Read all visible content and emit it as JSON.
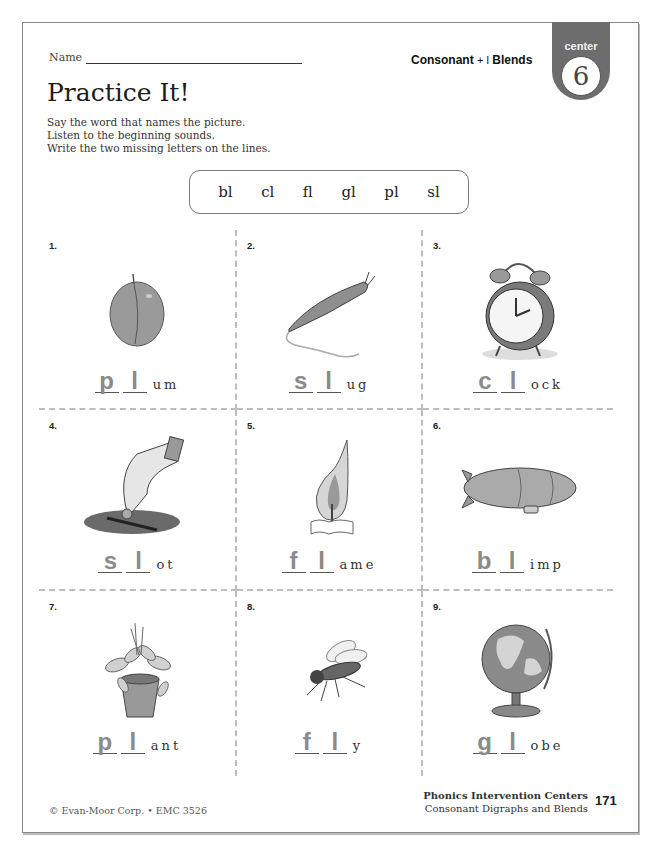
{
  "header": {
    "name_label": "Name",
    "topic_left": "Consonant",
    "topic_plus": "+ l",
    "topic_right": "Blends",
    "badge_label": "center",
    "badge_number": "6"
  },
  "title": "Practice It!",
  "instructions": [
    "Say the word that names the picture.",
    "Listen to the beginning sounds.",
    "Write the two missing letters on the lines."
  ],
  "word_bank": [
    "bl",
    "cl",
    "fl",
    "gl",
    "pl",
    "sl"
  ],
  "items": [
    {
      "number": "1.",
      "picture": "plum-icon",
      "letter1": "p",
      "letter2": "l",
      "rest": "um"
    },
    {
      "number": "2.",
      "picture": "slug-icon",
      "letter1": "s",
      "letter2": "l",
      "rest": "ug"
    },
    {
      "number": "3.",
      "picture": "clock-icon",
      "letter1": "c",
      "letter2": "l",
      "rest": "ock"
    },
    {
      "number": "4.",
      "picture": "slot-icon",
      "letter1": "s",
      "letter2": "l",
      "rest": "ot"
    },
    {
      "number": "5.",
      "picture": "flame-icon",
      "letter1": "f",
      "letter2": "l",
      "rest": "ame"
    },
    {
      "number": "6.",
      "picture": "blimp-icon",
      "letter1": "b",
      "letter2": "l",
      "rest": "imp"
    },
    {
      "number": "7.",
      "picture": "plant-icon",
      "letter1": "p",
      "letter2": "l",
      "rest": "ant"
    },
    {
      "number": "8.",
      "picture": "fly-icon",
      "letter1": "f",
      "letter2": "l",
      "rest": "y"
    },
    {
      "number": "9.",
      "picture": "globe-icon",
      "letter1": "g",
      "letter2": "l",
      "rest": "obe"
    }
  ],
  "footer": {
    "copyright": "© Evan-Moor Corp. • EMC 3526",
    "series": "Phonics Intervention Centers",
    "subtitle": "Consonant Digraphs and Blends",
    "page_number": "171"
  },
  "colors": {
    "badge": "#6d6d6d",
    "answer_letters": "#8a8a8a",
    "grid_lines": "#bdbdbd"
  }
}
